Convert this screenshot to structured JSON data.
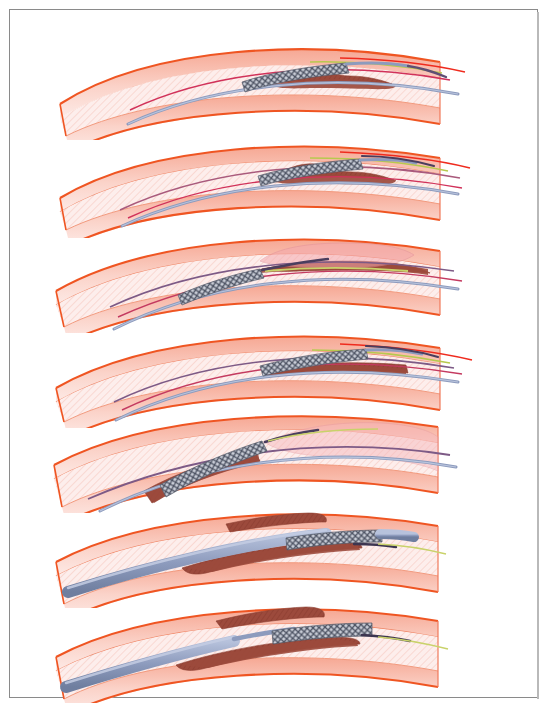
{
  "figure": {
    "border_color": "#8a8a8a",
    "background": "#ffffff",
    "panel_count": 7
  },
  "palette": {
    "vessel_outer_line": "#ef5522",
    "vessel_wall_fill": "#f9c7bd",
    "vessel_lumen_fill": "#fdeeec",
    "plaque_fill": "#9c4a3c",
    "plaque_fill_light": "#a55245",
    "stent_mesh": "#6e7687",
    "stent_mesh_dark": "#4b5160",
    "guidewire_blue": "#8d9bbd",
    "guidewire_dark": "#5f4f74",
    "catheter_blue": "#93a3c4",
    "marker_green": "#b7c94e",
    "marker_crimson": "#d1325a",
    "marker_red": "#ef2b1e",
    "balloon_pink": "#f4a9ae",
    "label_color": "#111111"
  },
  "panels": [
    {
      "id": "panel-a",
      "label": "a",
      "label_y": 88,
      "top": 22,
      "caption": "Guidewire advanced across the stenosis with the crimped stent on the balloon catheter positioned proximal to the plaque",
      "stent": {
        "x": 232,
        "width": 98,
        "deployed": false,
        "position": "proximal-to-lesion"
      },
      "plaque": {
        "x": 262,
        "width": 120,
        "side": "lower",
        "severity": "moderate"
      },
      "lumen_state": "stenosed",
      "balloon_inflated": false,
      "wires": [
        "guidewire-blue",
        "marker-crimson",
        "marker-green",
        "marker-red"
      ]
    },
    {
      "id": "panel-b",
      "label": "b",
      "label_y": 182,
      "top": 120,
      "caption": "Crimped stent advanced so it straddles the atherosclerotic plaque before inflation",
      "stent": {
        "x": 248,
        "width": 100,
        "deployed": false,
        "position": "across-lesion"
      },
      "plaque": {
        "x": 262,
        "width": 120,
        "side": "lower",
        "severity": "moderate"
      },
      "lumen_state": "stenosed",
      "balloon_inflated": false,
      "wires": [
        "guidewire-blue",
        "guidewire-dark",
        "marker-crimson",
        "marker-green",
        "marker-red"
      ]
    },
    {
      "id": "panel-c",
      "label": "c",
      "label_y": 275,
      "top": 215,
      "caption": "Balloon inflated distally dilating the vessel; the stent remains proximal and undeployed",
      "stent": {
        "x": 168,
        "width": 92,
        "deployed": false,
        "position": "proximal"
      },
      "plaque": {
        "x": 270,
        "width": 150,
        "side": "upper",
        "severity": "severe"
      },
      "lumen_state": "dilated-balloon",
      "balloon_inflated": true,
      "balloon": {
        "x": 250,
        "width": 125
      },
      "wires": [
        "guidewire-blue",
        "guidewire-dark",
        "marker-green",
        "marker-crimson"
      ]
    },
    {
      "id": "panel-d",
      "label": "d",
      "label_y": 360,
      "top": 310,
      "caption": "Stent repositioned over the flattened plaque, still crimped on the deflated balloon",
      "stent": {
        "x": 250,
        "width": 105,
        "deployed": false,
        "position": "across-lesion"
      },
      "plaque": {
        "x": 262,
        "width": 135,
        "side": "lower",
        "severity": "flattened"
      },
      "lumen_state": "partially-open",
      "balloon_inflated": false,
      "wires": [
        "guidewire-blue",
        "guidewire-dark",
        "marker-crimson",
        "marker-green",
        "marker-red"
      ]
    },
    {
      "id": "panel-e",
      "label": "e",
      "label_y": 450,
      "top": 395,
      "caption": "Stent deployed proximally while the balloon is inflated in the distal segment, widening the lumen",
      "stent": {
        "x": 175,
        "width": 110,
        "deployed": true,
        "position": "proximal"
      },
      "plaque": {
        "x": 190,
        "width": 130,
        "side": "lower",
        "severity": "severe"
      },
      "lumen_state": "dilated-balloon",
      "balloon_inflated": true,
      "balloon": {
        "x": 300,
        "width": 160
      },
      "wires": [
        "guidewire-blue",
        "guidewire-dark"
      ]
    },
    {
      "id": "panel-f",
      "label": "f",
      "label_y": 545,
      "top": 490,
      "caption": "Guide catheter with crimped stent advanced through the lesion between opposing plaques",
      "stent": {
        "x": 280,
        "width": 110,
        "deployed": false,
        "position": "across-lesion"
      },
      "plaque": {
        "x": 250,
        "width": 140,
        "side": "both",
        "severity": "severe"
      },
      "lumen_state": "stenosed",
      "balloon_inflated": false,
      "catheter": {
        "thick": true
      },
      "wires": [
        "catheter-blue",
        "guidewire-dark",
        "marker-green"
      ]
    },
    {
      "id": "panel-g",
      "label": "g",
      "label_y": 640,
      "top": 585,
      "caption": "Stent positioned at the target lesion ready for final deployment",
      "stent": {
        "x": 265,
        "width": 115,
        "deployed": false,
        "position": "across-lesion"
      },
      "plaque": {
        "x": 240,
        "width": 150,
        "side": "both",
        "severity": "severe"
      },
      "lumen_state": "stenosed",
      "balloon_inflated": false,
      "catheter": {
        "thick": true
      },
      "wires": [
        "catheter-blue",
        "guidewire-dark",
        "marker-green"
      ]
    }
  ]
}
